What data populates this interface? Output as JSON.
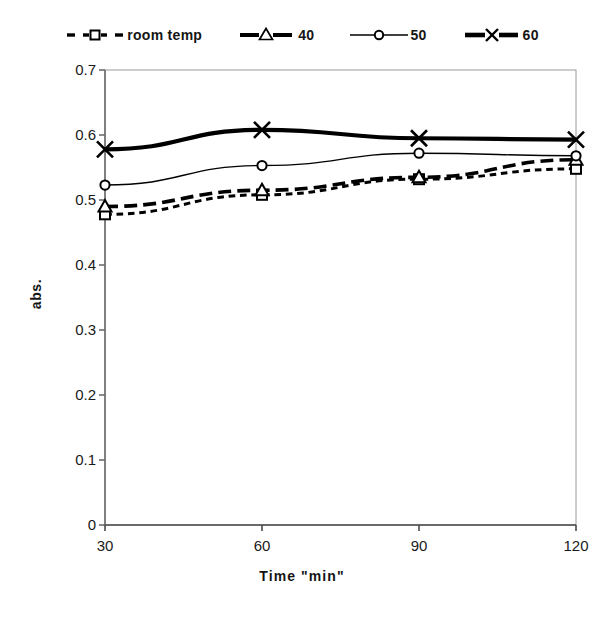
{
  "chart_data": {
    "type": "line",
    "title": "",
    "xlabel": "Time \"min\"",
    "ylabel": "abs.",
    "x": [
      30,
      60,
      90,
      120
    ],
    "xtick_labels": [
      "30",
      "60",
      "90",
      "120"
    ],
    "ytick_labels": [
      "0",
      "0.1",
      "0.2",
      "0.3",
      "0.4",
      "0.5",
      "0.6",
      "0.7"
    ],
    "ytick_values": [
      0,
      0.1,
      0.2,
      0.3,
      0.4,
      0.5,
      0.6,
      0.7
    ],
    "xlim": [
      30,
      120
    ],
    "ylim": [
      0,
      0.7
    ],
    "grid": false,
    "legend_position": "top",
    "series": [
      {
        "name": "room temp",
        "values": [
          0.478,
          0.508,
          0.532,
          0.548
        ],
        "marker": "open-square",
        "line_style": "dotted",
        "line_width": 3,
        "color": "#000000"
      },
      {
        "name": "40",
        "values": [
          0.49,
          0.515,
          0.535,
          0.562
        ],
        "marker": "open-triangle",
        "line_style": "dashed",
        "line_width": 3.6,
        "color": "#000000"
      },
      {
        "name": "50",
        "values": [
          0.523,
          0.553,
          0.572,
          0.568
        ],
        "marker": "open-circle",
        "line_style": "solid",
        "line_width": 1.4,
        "color": "#000000"
      },
      {
        "name": "60",
        "values": [
          0.578,
          0.608,
          0.595,
          0.593
        ],
        "marker": "cross-x",
        "line_style": "solid",
        "line_width": 4.2,
        "color": "#000000"
      }
    ]
  },
  "legend": {
    "items": [
      {
        "label": "room temp",
        "swatch": "dotted-open-square-swatch"
      },
      {
        "label": "40",
        "swatch": "dashed-open-triangle-swatch"
      },
      {
        "label": "50",
        "swatch": "solid-open-circle-swatch"
      },
      {
        "label": "60",
        "swatch": "thick-cross-x-swatch"
      }
    ]
  },
  "axes": {
    "x_title": "Time \"min\"",
    "y_title": "abs."
  }
}
